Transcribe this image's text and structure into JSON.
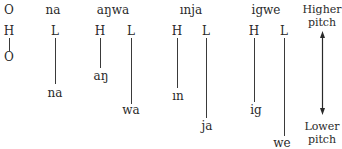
{
  "legend": {
    "symbol": "O",
    "high_label": "H",
    "low_label": "O"
  },
  "columns": [
    {
      "word": "na",
      "tones": [
        "L"
      ],
      "syllables": [
        "na"
      ]
    },
    {
      "word": "aŋwa",
      "tones": [
        "H",
        "L"
      ],
      "syllables": [
        "aŋ",
        "wa"
      ]
    },
    {
      "word": "ınja",
      "tones": [
        "H",
        "L"
      ],
      "syllables": [
        "ın",
        "ja"
      ]
    },
    {
      "word": "igwe",
      "tones": [
        "H",
        "L"
      ],
      "syllables": [
        "ig",
        "we"
      ]
    }
  ],
  "pitch_axis": {
    "top_line1": "Higher",
    "top_line2": "pitch",
    "bottom_line1": "Lower",
    "bottom_line2": "pitch"
  },
  "colors": {
    "ink": "#2a2a2a",
    "background": "#ffffff"
  }
}
